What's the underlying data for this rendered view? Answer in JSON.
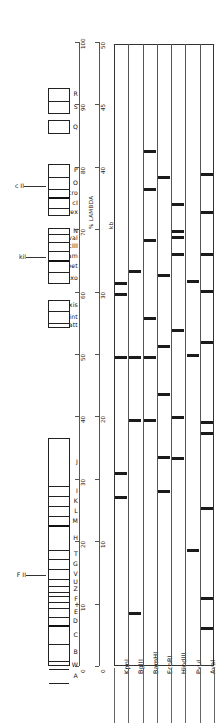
{
  "figure": {
    "kind": "lambda-phage-genetic-and-restriction-map",
    "background": "#ffffff",
    "ink": "#1a1a1a"
  },
  "gene_map": {
    "name": "lambda genetic map",
    "clusters": [
      {
        "id": "late-lysis",
        "top": 88,
        "height": 26,
        "segments": [
          {
            "label": "R",
            "height": 13,
            "thick": false
          },
          {
            "label": "S",
            "height": 13,
            "thick": false
          }
        ]
      },
      {
        "id": "Q-gene",
        "top": 120,
        "height": 14,
        "segments": [
          {
            "label": "Q",
            "height": 14,
            "thick": false
          }
        ]
      },
      {
        "id": "regulatory-region",
        "top": 164,
        "height": 52,
        "segments": [
          {
            "label": "P",
            "height": 13,
            "thick": false
          },
          {
            "label": "O",
            "height": 12,
            "thick": false
          },
          {
            "label": "cro",
            "height": 9,
            "thick": true
          },
          {
            "label": "cI",
            "height": 10,
            "thick": false
          },
          {
            "label": "rex",
            "height": 8,
            "thick": false
          }
        ]
      },
      {
        "id": "recombination-region",
        "top": 228,
        "height": 56,
        "segments": [
          {
            "label": "N",
            "height": 6,
            "thick": false
          },
          {
            "label": "val",
            "height": 8,
            "thick": false
          },
          {
            "label": "cIII",
            "height": 9,
            "thick": false
          },
          {
            "label": "gam",
            "height": 10,
            "thick": true
          },
          {
            "label": "bet",
            "height": 11,
            "thick": false
          },
          {
            "label": "exo",
            "height": 12,
            "thick": false
          }
        ]
      },
      {
        "id": "integration-region",
        "top": 300,
        "height": 28,
        "segments": [
          {
            "label": "xis",
            "height": 11,
            "thick": false
          },
          {
            "label": "int",
            "height": 12,
            "thick": false
          },
          {
            "label": "att",
            "height": 5,
            "thick": false
          }
        ]
      },
      {
        "id": "head-and-tail-region",
        "top": 438,
        "height": 228,
        "segments": [
          {
            "label": "J",
            "height": 48,
            "thick": false
          },
          {
            "label": "I",
            "height": 10,
            "thick": false
          },
          {
            "label": "K",
            "height": 10,
            "thick": false
          },
          {
            "label": "L",
            "height": 10,
            "thick": false
          },
          {
            "label": "M",
            "height": 10,
            "thick": true
          },
          {
            "label": "H",
            "height": 24,
            "thick": false
          },
          {
            "label": "T",
            "height": 9,
            "thick": false
          },
          {
            "label": "G",
            "height": 10,
            "thick": false
          },
          {
            "label": "V",
            "height": 10,
            "thick": false
          },
          {
            "label": "U",
            "height": 7,
            "thick": false
          },
          {
            "label": "Z",
            "height": 6,
            "thick": false
          },
          {
            "label": "",
            "height": 4,
            "thick": false
          },
          {
            "label": "F",
            "height": 6,
            "thick": false
          },
          {
            "label": "I",
            "height": 6,
            "thick": false
          },
          {
            "label": "E",
            "height": 9,
            "thick": false
          },
          {
            "label": "D",
            "height": 9,
            "thick": true
          },
          {
            "label": "C",
            "height": 18,
            "thick": false
          },
          {
            "label": "B",
            "height": 17,
            "thick": false
          },
          {
            "label": "W",
            "height": 8,
            "thick": false
          },
          {
            "label": "A",
            "height": 14,
            "thick": false
          },
          {
            "label": "",
            "height": 3,
            "thick": false
          }
        ]
      }
    ],
    "side_annotations": [
      {
        "id": "cII",
        "label": "c II",
        "top": 186,
        "lead_from": 24,
        "lead_to": 46
      },
      {
        "id": "kil",
        "label": "kil",
        "top": 257,
        "lead_from": 26,
        "lead_to": 46
      },
      {
        "id": "FII",
        "label": "F II",
        "top": 575,
        "lead_from": 26,
        "lead_to": 46
      }
    ]
  },
  "percent_axis": {
    "title": "% LAMBDA",
    "ticks": [
      "100",
      "90",
      "80",
      "70",
      "60",
      "50",
      "40",
      "30",
      "20",
      "10",
      "0"
    ],
    "top": 42,
    "bottom": 666,
    "color": "#555555"
  },
  "kb_axis": {
    "title": "kb",
    "ticks": [
      "50",
      "45",
      "40",
      "35",
      "30",
      "25",
      "20",
      "15",
      "10",
      "5",
      "0"
    ],
    "labeled_ticks": [
      "50",
      "45",
      "40",
      "30",
      "20",
      "10",
      "0"
    ],
    "top": 42,
    "bottom": 666,
    "color": "#555555"
  },
  "gel": {
    "title": "restriction digest lanes",
    "top": 44,
    "bottom": 666,
    "left": 114,
    "right": 214,
    "band_color": "#1b1b1b",
    "lanes": [
      {
        "name": "KpnI",
        "bands": [
          {
            "pos": 282,
            "thickness": 3.0,
            "width": 12
          },
          {
            "pos": 293,
            "thickness": 3.0,
            "width": 12
          },
          {
            "pos": 356,
            "thickness": 2.5,
            "width": 12
          },
          {
            "pos": 472,
            "thickness": 3.0,
            "width": 12
          },
          {
            "pos": 496,
            "thickness": 3.0,
            "width": 12
          }
        ]
      },
      {
        "name": "BglII",
        "bands": [
          {
            "pos": 270,
            "thickness": 2.5,
            "width": 12
          },
          {
            "pos": 356,
            "thickness": 2.5,
            "width": 12
          },
          {
            "pos": 419,
            "thickness": 2.5,
            "width": 12
          },
          {
            "pos": 612,
            "thickness": 3.0,
            "width": 12
          }
        ]
      },
      {
        "name": "BamHI",
        "bands": [
          {
            "pos": 150,
            "thickness": 2.5,
            "width": 12
          },
          {
            "pos": 188,
            "thickness": 3.0,
            "width": 12
          },
          {
            "pos": 239,
            "thickness": 3.0,
            "width": 12
          },
          {
            "pos": 317,
            "thickness": 2.5,
            "width": 12
          },
          {
            "pos": 356,
            "thickness": 2.5,
            "width": 12
          },
          {
            "pos": 419,
            "thickness": 2.5,
            "width": 12
          }
        ]
      },
      {
        "name": "EcoRI",
        "bands": [
          {
            "pos": 176,
            "thickness": 2.5,
            "width": 12
          },
          {
            "pos": 274,
            "thickness": 2.5,
            "width": 12
          },
          {
            "pos": 345,
            "thickness": 2.5,
            "width": 12
          },
          {
            "pos": 393,
            "thickness": 2.5,
            "width": 12
          },
          {
            "pos": 456,
            "thickness": 2.5,
            "width": 12
          },
          {
            "pos": 490,
            "thickness": 2.5,
            "width": 12
          }
        ]
      },
      {
        "name": "HindIII",
        "bands": [
          {
            "pos": 203,
            "thickness": 3.0,
            "width": 12
          },
          {
            "pos": 230,
            "thickness": 3.0,
            "width": 12
          },
          {
            "pos": 236,
            "thickness": 3.0,
            "width": 12
          },
          {
            "pos": 253,
            "thickness": 2.5,
            "width": 12
          },
          {
            "pos": 329,
            "thickness": 2.5,
            "width": 12
          },
          {
            "pos": 416,
            "thickness": 2.5,
            "width": 12
          },
          {
            "pos": 457,
            "thickness": 2.5,
            "width": 12
          }
        ]
      },
      {
        "name": "PvuI",
        "bands": [
          {
            "pos": 280,
            "thickness": 2.5,
            "width": 12
          },
          {
            "pos": 354,
            "thickness": 2.5,
            "width": 12
          },
          {
            "pos": 549,
            "thickness": 3.0,
            "width": 12
          }
        ]
      },
      {
        "name": "AvaI",
        "bands": [
          {
            "pos": 173,
            "thickness": 2.5,
            "width": 12
          },
          {
            "pos": 211,
            "thickness": 2.5,
            "width": 12
          },
          {
            "pos": 253,
            "thickness": 2.5,
            "width": 12
          },
          {
            "pos": 290,
            "thickness": 2.5,
            "width": 12
          },
          {
            "pos": 341,
            "thickness": 2.5,
            "width": 12
          },
          {
            "pos": 421,
            "thickness": 2.5,
            "width": 12
          },
          {
            "pos": 432,
            "thickness": 2.5,
            "width": 12
          },
          {
            "pos": 507,
            "thickness": 2.5,
            "width": 12
          },
          {
            "pos": 597,
            "thickness": 2.5,
            "width": 12
          },
          {
            "pos": 627,
            "thickness": 2.5,
            "width": 12
          }
        ]
      }
    ]
  }
}
